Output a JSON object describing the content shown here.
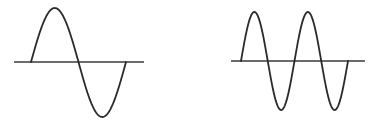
{
  "figure": {
    "background": "#ffffff",
    "line_color": "#2a2a2a",
    "axis_color": "#3a3a3a"
  },
  "panels": [
    {
      "name": "low-frequency-wave",
      "cycles": 1,
      "axis": {
        "x1": 14,
        "x2": 144,
        "y": 62
      },
      "wave": {
        "x_start": 31,
        "x_end": 126,
        "amplitude_up": 54,
        "amplitude_down": 55,
        "baseline": 62
      }
    },
    {
      "name": "high-frequency-wave",
      "cycles": 2,
      "axis": {
        "x1": 231,
        "x2": 365,
        "y": 61
      },
      "wave": {
        "x_start": 241,
        "x_end": 348,
        "amplitude_up": 49,
        "amplitude_down": 49,
        "baseline": 61
      }
    }
  ]
}
